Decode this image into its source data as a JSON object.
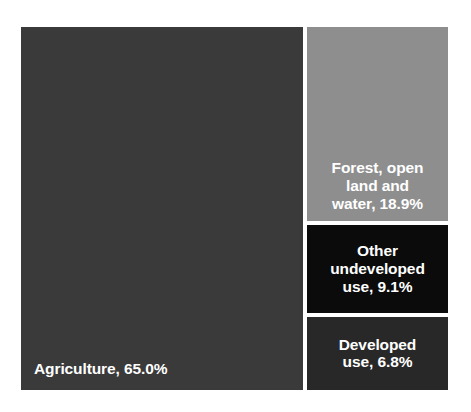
{
  "chart_data": {
    "type": "treemap",
    "title": "",
    "subtitle": "",
    "xlabel": "",
    "ylabel": "",
    "legend": "none",
    "grid": false,
    "value_unit": "percent",
    "categories": [
      "Agriculture",
      "Forest, open land and water",
      "Other undeveloped use",
      "Developed use"
    ],
    "values": [
      65.0,
      18.9,
      9.1,
      6.8
    ],
    "labels": [
      "Agriculture, 65.0%",
      "Forest, open\nland and\nwater, 18.9%",
      "Other\nundeveloped\nuse, 9.1%",
      "Developed\nuse, 6.8%"
    ],
    "tiles": [
      {
        "name": "Agriculture",
        "value": 65.0,
        "value_text": "65.0%",
        "label": "Agriculture, 65.0%",
        "color": "#3a3a3a",
        "text_color": "#ffffff"
      },
      {
        "name": "Forest, open land and water",
        "value": 18.9,
        "value_text": "18.9%",
        "label": "Forest, open\nland and\nwater, 18.9%",
        "color": "#8e8e8e",
        "text_color": "#ffffff"
      },
      {
        "name": "Other undeveloped use",
        "value": 9.1,
        "value_text": "9.1%",
        "label": "Other\nundeveloped\nuse, 9.1%",
        "color": "#0b0b0b",
        "text_color": "#ffffff"
      },
      {
        "name": "Developed use",
        "value": 6.8,
        "value_text": "6.8%",
        "label": "Developed\nuse, 6.8%",
        "color": "#282828",
        "text_color": "#ffffff"
      }
    ],
    "colors": {
      "background": "#ffffff",
      "gap": "#ffffff",
      "agriculture": "#3a3a3a",
      "forest_open_land_and_water": "#8e8e8e",
      "other_undeveloped_use": "#0b0b0b",
      "developed_use": "#282828"
    }
  }
}
